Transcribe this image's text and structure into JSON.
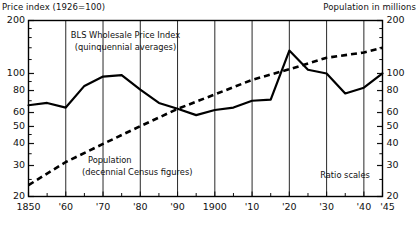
{
  "header": {
    "left_title": "Price index (1926=100)",
    "right_title": "Population in millions"
  },
  "annotations": {
    "series1_line1": "BLS Wholesale Price Index",
    "series1_line2": "(quinquennial averages)",
    "series2_line1": "Population",
    "series2_line2": "(decennial Census figures)",
    "scale_note": "Ratio scales"
  },
  "chart_data": {
    "type": "line",
    "title": "Price index (1926=100)",
    "subtitle": "",
    "xlabel": "",
    "ylabel": "Price index (1926=100)",
    "y2label": "Population in millions",
    "scale": "log",
    "ylim": [
      20,
      200
    ],
    "xlim": [
      1850,
      1945
    ],
    "grid": "vertical-decades",
    "legend": "inline-annotations",
    "y_ticks": [
      20,
      30,
      40,
      50,
      60,
      80,
      100,
      200
    ],
    "y_tick_labels": [
      "20",
      "30",
      "40",
      "50",
      "60",
      "80",
      "100",
      "200"
    ],
    "y2_ticks": [
      20,
      30,
      40,
      50,
      60,
      80,
      100,
      200
    ],
    "y2_tick_labels": [
      "20",
      "30",
      "40",
      "50",
      "60",
      "80",
      "100",
      "200"
    ],
    "x_ticks": [
      1850,
      1860,
      1870,
      1880,
      1890,
      1900,
      1910,
      1920,
      1930,
      1940,
      1945
    ],
    "x_tick_labels": [
      "1850",
      "'60",
      "'70",
      "'80",
      "'90",
      "1900",
      "'10",
      "'20",
      "'30",
      "'40",
      "'45"
    ],
    "x_minor_ticks": [
      1855,
      1865,
      1875,
      1885,
      1895,
      1905,
      1915,
      1925,
      1935,
      1945
    ],
    "series": [
      {
        "name": "BLS Wholesale Price Index",
        "note": "(quinquennial averages)",
        "style": "solid",
        "color": "#000000",
        "x": [
          1850,
          1855,
          1860,
          1865,
          1870,
          1875,
          1880,
          1885,
          1890,
          1895,
          1900,
          1905,
          1910,
          1915,
          1920,
          1925,
          1930,
          1935,
          1940,
          1945
        ],
        "values": [
          66,
          68,
          64,
          85,
          96,
          98,
          81,
          68,
          63,
          58,
          62,
          64,
          70,
          71,
          135,
          105,
          100,
          77,
          83,
          100
        ]
      },
      {
        "name": "Population",
        "note": "(decennial Census figures)",
        "style": "dashed",
        "color": "#000000",
        "x": [
          1850,
          1860,
          1870,
          1880,
          1890,
          1900,
          1910,
          1920,
          1930,
          1940,
          1945
        ],
        "values": [
          23.2,
          31.4,
          39.8,
          50.2,
          62.9,
          76.0,
          92.0,
          105.7,
          122.8,
          131.7,
          139.9
        ]
      }
    ]
  }
}
